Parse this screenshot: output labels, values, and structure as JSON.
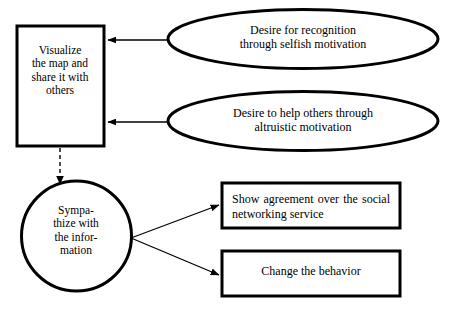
{
  "diagram": {
    "colors": {
      "stroke": "#000000",
      "fill": "#ffffff",
      "text": "#000000"
    },
    "nodes": {
      "visualize_box": {
        "shape": "rectangle",
        "text": "Visualize\nthe map and\nshare it with\nothers"
      },
      "sympathize_circle": {
        "shape": "circle",
        "text": "Sympa-\nthize with\nthe infor-\nmation"
      },
      "ellipse_recognition": {
        "shape": "ellipse",
        "text": "Desire for recognition\nthrough selfish motivation"
      },
      "ellipse_altruistic": {
        "shape": "ellipse",
        "text": "Desire to help others through\naltruistic motivation"
      },
      "box_agreement": {
        "shape": "rectangle",
        "text": "Show agreement over the social networking service"
      },
      "box_behavior": {
        "shape": "rectangle",
        "text": "Change the behavior"
      }
    },
    "edges": [
      {
        "from": "ellipse_recognition",
        "to": "visualize_box",
        "style": "solid-arrow"
      },
      {
        "from": "ellipse_altruistic",
        "to": "visualize_box",
        "style": "solid-arrow"
      },
      {
        "from": "visualize_box",
        "to": "sympathize_circle",
        "style": "dashed-arrow"
      },
      {
        "from": "sympathize_circle",
        "to": "box_agreement",
        "style": "solid-arrow"
      },
      {
        "from": "sympathize_circle",
        "to": "box_behavior",
        "style": "solid-arrow"
      }
    ]
  }
}
